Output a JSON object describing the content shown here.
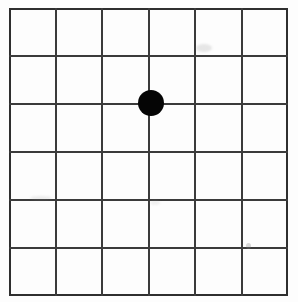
{
  "chart_data": {
    "type": "grid",
    "columns": 6,
    "rows": 6,
    "vertical_line_count": 7,
    "horizontal_line_count": 7,
    "cell_width_px": 46.5,
    "cell_height_px": 48,
    "grid_origin_px": [
      9,
      8
    ],
    "grid_size_px": [
      279,
      288
    ],
    "vertical_line_x": [
      9,
      55.5,
      102,
      148.5,
      195,
      241.5,
      288
    ],
    "horizontal_line_y": [
      8,
      56,
      104,
      152,
      200,
      248,
      296
    ],
    "marker": {
      "label": "fixation-dot",
      "shape": "circle",
      "fill": "#050505",
      "center_px": [
        151,
        103
      ],
      "diameter_px": 26,
      "grid_intersection": {
        "column_line_index": 3,
        "row_line_index": 2
      }
    },
    "grid": true,
    "legend": "none",
    "xlabel": "",
    "ylabel": "",
    "tick_labels": []
  },
  "figure": {
    "name": "amsler-grid",
    "background_color": "#fdfdfd",
    "line_color": "#3b3b3b",
    "frame_color": "#2f2f2f",
    "marker_color": "#050505",
    "frame_width_px": 2,
    "line_width_px": 2
  },
  "artifacts": [
    {
      "name": "scan-smudge-upper-right"
    },
    {
      "name": "scan-smudge-lower-right"
    },
    {
      "name": "scan-smudge-left"
    },
    {
      "name": "scan-smudge-center"
    }
  ]
}
